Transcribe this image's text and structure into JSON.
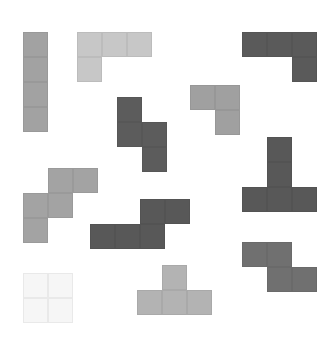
{
  "game": {
    "title": "Tetromino pieces",
    "pieces": [
      {
        "id": "i-vertical",
        "shape": "I",
        "color": "#a2a2a2",
        "cells": [
          [
            0,
            0
          ],
          [
            0,
            1
          ],
          [
            0,
            2
          ],
          [
            0,
            3
          ]
        ]
      },
      {
        "id": "j-light",
        "shape": "J",
        "color": "#c7c7c7",
        "cells": [
          [
            0,
            0
          ],
          [
            1,
            0
          ],
          [
            2,
            0
          ],
          [
            0,
            1
          ]
        ]
      },
      {
        "id": "l-dark-top",
        "shape": "L",
        "color": "#5a5a5a",
        "cells": [
          [
            0,
            0
          ],
          [
            1,
            0
          ],
          [
            2,
            0
          ],
          [
            2,
            1
          ]
        ]
      },
      {
        "id": "s-dark-vertical",
        "shape": "S",
        "color": "#5c5c5c",
        "cells": [
          [
            0,
            0
          ],
          [
            0,
            1
          ],
          [
            1,
            1
          ],
          [
            1,
            2
          ]
        ]
      },
      {
        "id": "v-mid",
        "shape": "V",
        "color": "#a0a0a0",
        "cells": [
          [
            0,
            0
          ],
          [
            1,
            0
          ],
          [
            1,
            1
          ]
        ]
      },
      {
        "id": "t-dark",
        "shape": "T",
        "color": "#585858",
        "cells": [
          [
            1,
            0
          ],
          [
            1,
            1
          ],
          [
            0,
            2
          ],
          [
            1,
            2
          ],
          [
            2,
            2
          ]
        ]
      },
      {
        "id": "s-mid-left",
        "shape": "S",
        "color": "#a3a3a3",
        "cells": [
          [
            1,
            0
          ],
          [
            2,
            0
          ],
          [
            0,
            1
          ],
          [
            1,
            1
          ],
          [
            0,
            2
          ]
        ]
      },
      {
        "id": "l-dark-bottom",
        "shape": "L",
        "color": "#585858",
        "cells": [
          [
            2,
            0
          ],
          [
            3,
            0
          ],
          [
            0,
            1
          ],
          [
            1,
            1
          ],
          [
            2,
            1
          ]
        ]
      },
      {
        "id": "o-ghost",
        "shape": "O",
        "color": "#f6f6f6",
        "cells": [
          [
            0,
            0
          ],
          [
            1,
            0
          ],
          [
            0,
            1
          ],
          [
            1,
            1
          ]
        ]
      },
      {
        "id": "t-light",
        "shape": "T",
        "color": "#b3b3b3",
        "cells": [
          [
            1,
            0
          ],
          [
            0,
            1
          ],
          [
            1,
            1
          ],
          [
            2,
            1
          ]
        ]
      },
      {
        "id": "z-gray",
        "shape": "Z",
        "color": "#707070",
        "cells": [
          [
            0,
            0
          ],
          [
            1,
            0
          ],
          [
            1,
            1
          ],
          [
            2,
            1
          ]
        ]
      }
    ]
  }
}
